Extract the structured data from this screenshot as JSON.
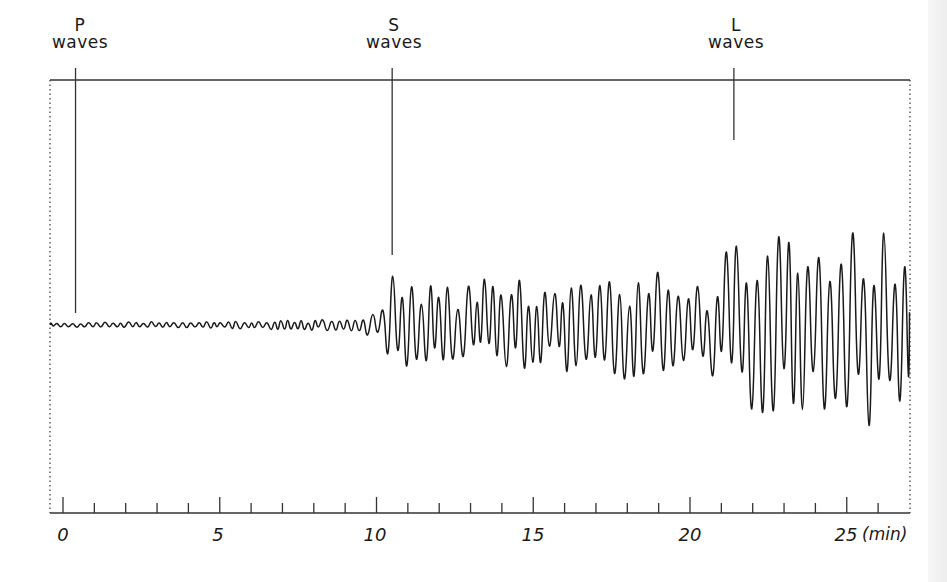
{
  "figure": {
    "title": "",
    "background": "#ffffff",
    "ink_color": "#1a1a1a"
  },
  "markers": [
    {
      "id": "p",
      "letter": "P",
      "word": "waves",
      "time_min": 0.4
    },
    {
      "id": "s",
      "letter": "S",
      "word": "waves",
      "time_min": 10.5
    },
    {
      "id": "l",
      "letter": "L",
      "word": "waves",
      "time_min": 21.4
    }
  ],
  "axis": {
    "unit_label": "(min)",
    "major_ticks": [
      0,
      5,
      10,
      15,
      20,
      25
    ],
    "major_labels": [
      "0",
      "5",
      "10",
      "15",
      "20",
      "25"
    ],
    "minor_step": 1,
    "range_min": [
      -0.4,
      27
    ]
  },
  "chart_data": {
    "type": "line",
    "title": "",
    "xlabel": "(min)",
    "ylabel": "",
    "xlim": [
      -0.4,
      27
    ],
    "ylim": [
      -1,
      1
    ],
    "grid": false,
    "legend": [],
    "annotations": [
      {
        "text": "P waves",
        "x": 0.4
      },
      {
        "text": "S waves",
        "x": 10.5
      },
      {
        "text": "L waves",
        "x": 21.4
      }
    ],
    "x_ticks": [
      0,
      5,
      10,
      15,
      20,
      25
    ],
    "series": [
      {
        "name": "seismogram amplitude envelope (relative)",
        "x": [
          -0.4,
          0,
          2,
          4,
          6,
          8,
          9,
          9.5,
          10,
          10.5,
          11,
          12,
          13,
          14,
          15,
          16,
          17,
          18,
          19,
          20,
          20.5,
          21,
          21.5,
          22,
          23,
          24,
          25,
          26,
          27
        ],
        "values": [
          0.02,
          0.02,
          0.03,
          0.03,
          0.04,
          0.05,
          0.06,
          0.08,
          0.12,
          0.45,
          0.52,
          0.4,
          0.38,
          0.45,
          0.42,
          0.45,
          0.45,
          0.5,
          0.55,
          0.45,
          0.35,
          0.6,
          0.85,
          0.95,
          0.98,
          0.95,
          0.92,
          0.9,
          0.9
        ]
      }
    ]
  }
}
